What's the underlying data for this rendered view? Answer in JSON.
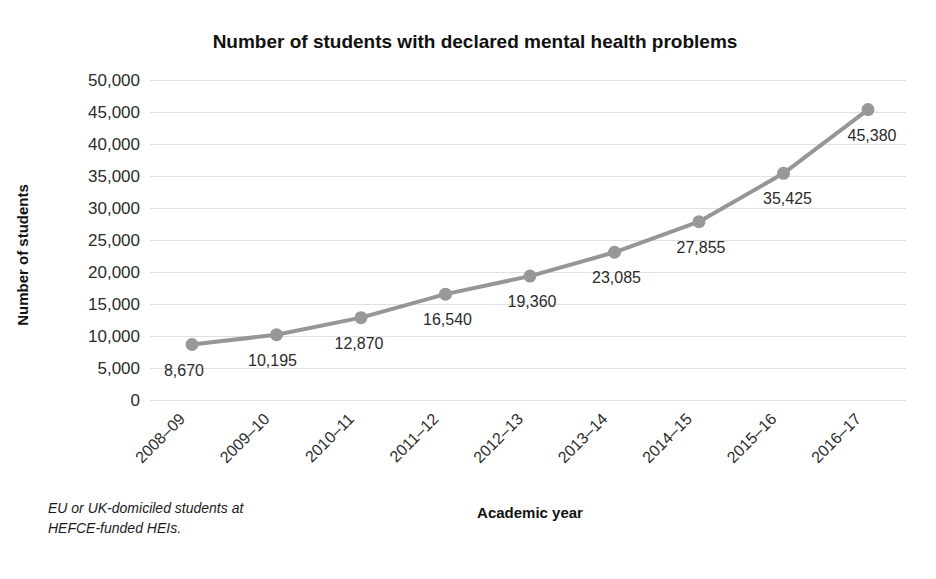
{
  "chart_data": {
    "type": "line",
    "title": "Number of students with declared mental health problems",
    "xlabel": "Academic year",
    "ylabel": "Number of students",
    "categories": [
      "2008–09",
      "2009–10",
      "2010–11",
      "2011–12",
      "2012–13",
      "2013–14",
      "2014–15",
      "2015–16",
      "2016–17"
    ],
    "values": [
      8670,
      10195,
      12870,
      16540,
      19360,
      23085,
      27855,
      35425,
      45380
    ],
    "point_labels": [
      "8,670",
      "10,195",
      "12,870",
      "16,540",
      "19,360",
      "23,085",
      "27,855",
      "35,425",
      "45,380"
    ],
    "ylim": [
      0,
      50000
    ],
    "ytick_values": [
      50000,
      45000,
      40000,
      35000,
      30000,
      25000,
      20000,
      15000,
      10000,
      5000,
      0
    ],
    "ytick_labels": [
      "50,000",
      "45,000",
      "40,000",
      "35,000",
      "30,000",
      "25,000",
      "20,000",
      "15,000",
      "10,000",
      "5,000",
      "0"
    ],
    "grid": true,
    "legend": "none",
    "series_color": "#969696",
    "grid_color": "#e0e0e0",
    "marker_color": "#989898",
    "footnote": "EU or UK-domiciled students at HEFCE-funded HEIs.",
    "footnote_lines": [
      "EU or UK-domiciled students at",
      "HEFCE-funded HEIs."
    ]
  }
}
